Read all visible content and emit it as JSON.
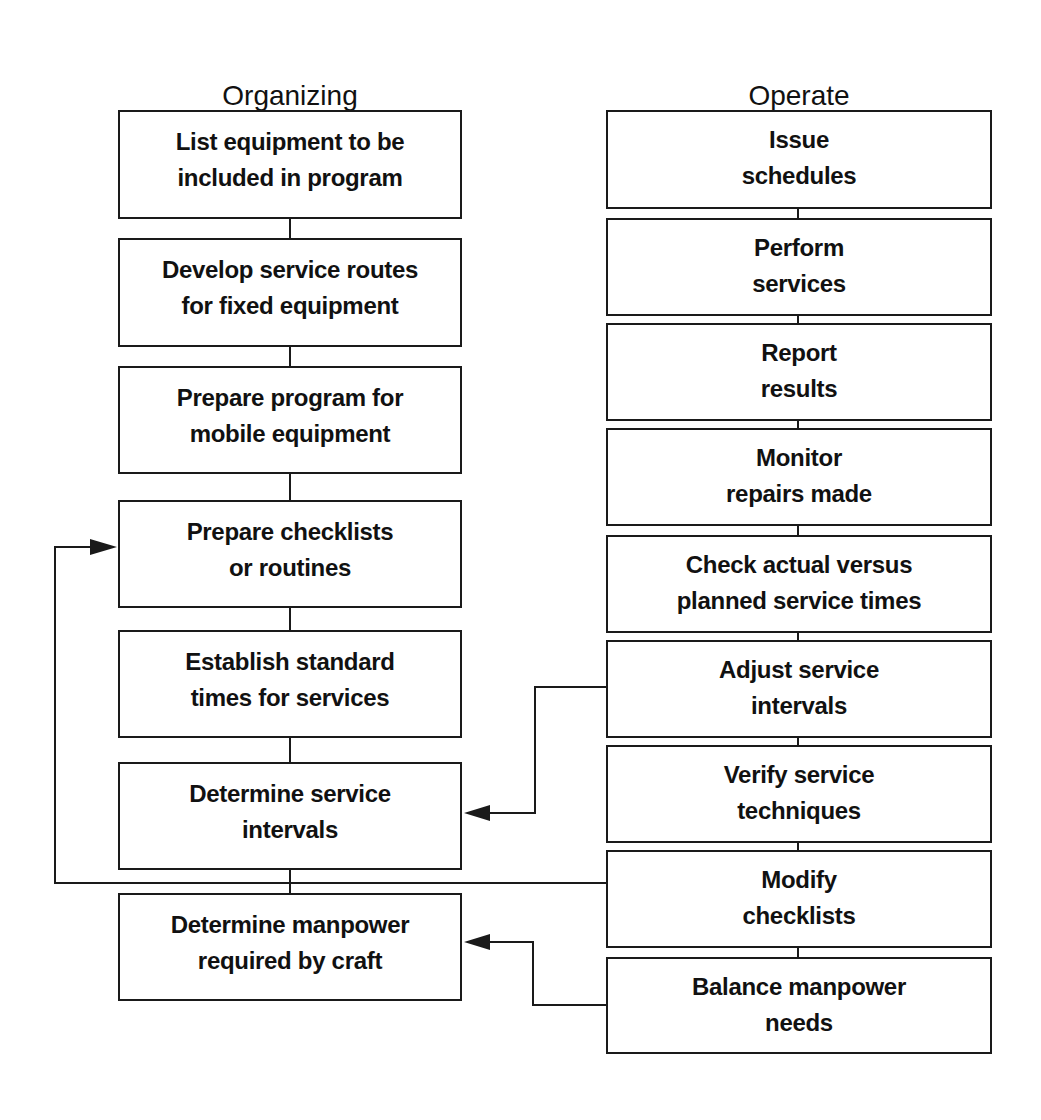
{
  "columns": {
    "organizing": {
      "title": "Organizing",
      "steps": [
        {
          "label": "List equipment to be\nincluded in program"
        },
        {
          "label": "Develop service routes\nfor fixed equipment"
        },
        {
          "label": "Prepare program for\nmobile equipment"
        },
        {
          "label": "Prepare checklists\nor routines"
        },
        {
          "label": "Establish standard\ntimes for services"
        },
        {
          "label": "Determine service\nintervals"
        },
        {
          "label": "Determine manpower\nrequired by craft"
        }
      ]
    },
    "operate": {
      "title": "Operate",
      "steps": [
        {
          "label": "Issue\nschedules"
        },
        {
          "label": "Perform\nservices"
        },
        {
          "label": "Report\nresults"
        },
        {
          "label": "Monitor\nrepairs made"
        },
        {
          "label": "Check actual versus\nplanned service times"
        },
        {
          "label": "Adjust service\nintervals"
        },
        {
          "label": "Verify service\ntechniques"
        },
        {
          "label": "Modify\nchecklists"
        },
        {
          "label": "Balance manpower\nneeds"
        }
      ]
    }
  },
  "feedback_arrows": [
    {
      "from": "Adjust service intervals",
      "to": "Determine service intervals"
    },
    {
      "from": "Modify checklists",
      "to": "Prepare checklists or routines"
    },
    {
      "from": "Balance manpower needs",
      "to": "Determine manpower required by craft"
    }
  ]
}
